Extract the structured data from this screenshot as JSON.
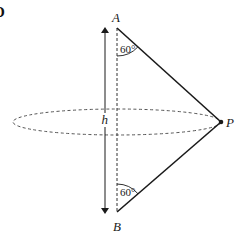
{
  "figure": {
    "corner_glyph": "D",
    "points": {
      "A": {
        "label": "A"
      },
      "B": {
        "label": "B"
      },
      "P": {
        "label": "P"
      }
    },
    "height_label": "h",
    "angle_top": "60°",
    "angle_bottom": "60°",
    "colors": {
      "line": "#1a1a1a",
      "dashed": "#555555",
      "background": "#ffffff"
    }
  }
}
